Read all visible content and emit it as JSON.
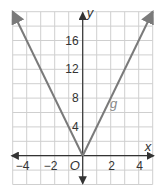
{
  "chart_data": {
    "type": "line",
    "title": "",
    "xlabel": "x",
    "ylabel": "y",
    "origin_label": "O",
    "xlim": [
      -5,
      5
    ],
    "ylim": [
      -4,
      20
    ],
    "grid": true,
    "x_grid_step": 1,
    "y_grid_step": 2,
    "x_tick_labels": [
      {
        "value": -4,
        "text": "−4"
      },
      {
        "value": -2,
        "text": "−2"
      },
      {
        "value": 2,
        "text": "2"
      },
      {
        "value": 4,
        "text": "4"
      }
    ],
    "y_tick_labels": [
      {
        "value": 4,
        "text": "4"
      },
      {
        "value": 8,
        "text": "8"
      },
      {
        "value": 12,
        "text": "12"
      },
      {
        "value": 16,
        "text": "16"
      }
    ],
    "series": [
      {
        "name": "g",
        "label": "g",
        "equation": "g(x) = 4|x|",
        "x": [
          -5,
          0,
          5
        ],
        "y": [
          20,
          0,
          20
        ],
        "arrows_at_ends": true
      }
    ],
    "colors": {
      "curve": "#7a7a7a",
      "axis": "#333333",
      "grid": "#cfcfcf",
      "background": "#ffffff"
    }
  }
}
